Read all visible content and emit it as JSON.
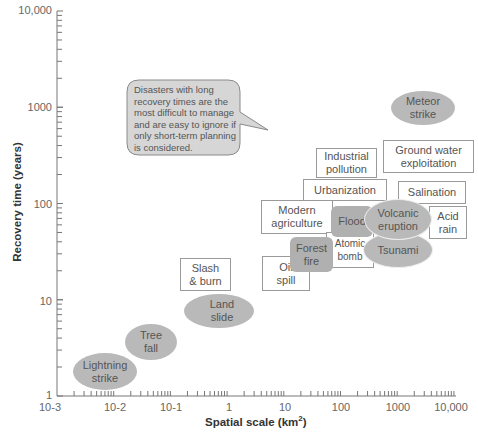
{
  "chart_data": {
    "type": "scatter",
    "title": "",
    "xlabel": "Spatial scale (km²)",
    "ylabel": "Recovery time (years)",
    "xscale": "log",
    "yscale": "log",
    "xlim": [
      0.001,
      10000
    ],
    "ylim": [
      1,
      10000
    ],
    "x_ticks": [
      "10-3",
      "10-2",
      "10-1",
      "1",
      "10",
      "100",
      "1000",
      "10,000"
    ],
    "y_ticks": [
      "1",
      "10",
      "100",
      "1000",
      "10,000"
    ],
    "legend": {
      "ellipse": "natural disaster",
      "box": "human-caused disaster",
      "rounded_rect": "natural or human-caused"
    },
    "points": [
      {
        "label": "Lightning strike",
        "shape": "ellipse",
        "x": 0.007,
        "y": 2
      },
      {
        "label": "Tree fall",
        "shape": "ellipse",
        "x": 0.03,
        "y": 4
      },
      {
        "label": "Land slide",
        "shape": "ellipse",
        "x": 0.8,
        "y": 9
      },
      {
        "label": "Slash & burn",
        "shape": "box",
        "x": 0.7,
        "y": 30
      },
      {
        "label": "Oil spill",
        "shape": "box",
        "x": 9,
        "y": 30
      },
      {
        "label": "Forest fire",
        "shape": "rounded",
        "x": 20,
        "y": 50
      },
      {
        "label": "Atomic bomb",
        "shape": "box",
        "x": 100,
        "y": 45
      },
      {
        "label": "Modern agriculture",
        "shape": "box",
        "x": 6,
        "y": 90
      },
      {
        "label": "Flood",
        "shape": "rounded",
        "x": 80,
        "y": 85
      },
      {
        "label": "Volcanic eruption",
        "shape": "ellipse",
        "x": 500,
        "y": 85
      },
      {
        "label": "Tsunami",
        "shape": "ellipse",
        "x": 500,
        "y": 40
      },
      {
        "label": "Acid rain",
        "shape": "box",
        "x": 5000,
        "y": 80
      },
      {
        "label": "Urbanization",
        "shape": "box",
        "x": 70,
        "y": 160
      },
      {
        "label": "Salination",
        "shape": "box",
        "x": 2000,
        "y": 150
      },
      {
        "label": "Industrial pollution",
        "shape": "box",
        "x": 60,
        "y": 400
      },
      {
        "label": "Ground water exploitation",
        "shape": "box",
        "x": 1500,
        "y": 400
      },
      {
        "label": "Meteor strike",
        "shape": "ellipse",
        "x": 2000,
        "y": 1000
      }
    ],
    "annotations": [
      "Disasters with long recovery times are the most difficult to manage and are easy to ignore if only short-term planning is considered."
    ],
    "grid": false
  },
  "axes": {
    "x_title": "Spatial scale (km",
    "x_title_sup": "2",
    "x_title_end": ")",
    "y_title": "Recovery time (years)",
    "x_ticks": [
      "10-3",
      "10-2",
      "10-1",
      "1",
      "10",
      "100",
      "1000",
      "10,000"
    ],
    "y_ticks": [
      "10,000",
      "1000",
      "100",
      "10",
      "1"
    ]
  },
  "callout": {
    "text": "Disasters with long recovery times are the most difficult to manage and are easy to ignore if only short-term planning is considered."
  },
  "items": {
    "meteor": "Meteor\nstrike",
    "industrial": "Industrial\npollution",
    "groundwater": "Ground water\nexploitation",
    "urbanization": "Urbanization",
    "salination": "Salination",
    "modern_ag": "Modern\nagriculture",
    "flood": "Flood",
    "volcanic": "Volcanic\neruption",
    "acid_rain": "Acid\nrain",
    "atomic": "Atomic\nbomb",
    "tsunami": "Tsunami",
    "forest_fire": "Forest\nfire",
    "oil_spill": "Oil\nspill",
    "slash_burn": "Slash\n& burn",
    "land_slide": "Land\nslide",
    "tree_fall": "Tree\nfall",
    "lightning": "Lightning\nstrike"
  },
  "colors": {
    "natural_fill": "#b9b9b9",
    "mixed_fill": "#b0b0b0",
    "box_border": "#9a9a9a",
    "callout_fill": "#d6d6d6",
    "axis": "#777777"
  }
}
